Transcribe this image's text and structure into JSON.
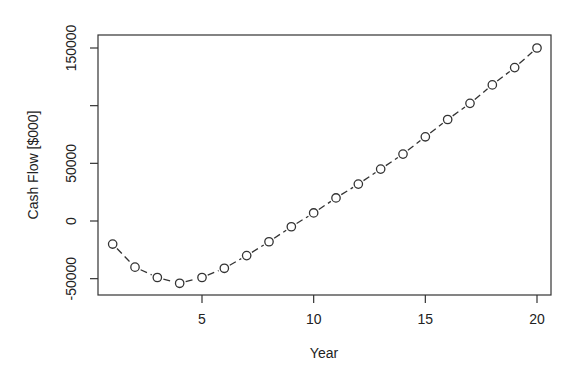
{
  "chart_data": {
    "type": "line",
    "title": "",
    "xlabel": "Year",
    "ylabel": "Cash Flow [$000]",
    "x": [
      1,
      2,
      3,
      4,
      5,
      6,
      7,
      8,
      9,
      10,
      11,
      12,
      13,
      14,
      15,
      16,
      17,
      18,
      19,
      20
    ],
    "series": [
      {
        "name": "Cash Flow",
        "values": [
          -20000,
          -40000,
          -49000,
          -54000,
          -49000,
          -41000,
          -30000,
          -18000,
          -5000,
          7000,
          20000,
          32000,
          45000,
          58000,
          73000,
          88000,
          102000,
          118000,
          133000,
          150000
        ],
        "style": "dashed line with open circle markers",
        "color": "#333333"
      }
    ],
    "xlim": [
      0.1,
      20.7
    ],
    "ylim": [
      -67000,
      161000
    ],
    "xticks": [
      5,
      10,
      15,
      20
    ],
    "xtick_labels": [
      "5",
      "10",
      "15",
      "20"
    ],
    "yticks": [
      -50000,
      0,
      50000,
      100000,
      150000
    ],
    "ytick_labels": [
      "-50000",
      "0",
      "50000",
      "",
      "150000"
    ],
    "grid": false,
    "legend": null
  }
}
